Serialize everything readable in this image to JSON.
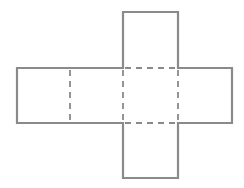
{
  "diagram": {
    "type": "cube-net",
    "stroke_color": "#8a8a8a",
    "solid_width": 2.2,
    "dashed_width": 1.8,
    "faces": [
      {
        "name": "top",
        "x": 123,
        "y": 12,
        "w": 55,
        "h": 56
      },
      {
        "name": "far-left",
        "x": 17,
        "y": 68,
        "w": 53,
        "h": 55
      },
      {
        "name": "left",
        "x": 70,
        "y": 68,
        "w": 53,
        "h": 55
      },
      {
        "name": "center",
        "x": 123,
        "y": 68,
        "w": 55,
        "h": 55
      },
      {
        "name": "right",
        "x": 178,
        "y": 68,
        "w": 54,
        "h": 55
      },
      {
        "name": "bottom",
        "x": 123,
        "y": 123,
        "w": 55,
        "h": 55
      }
    ]
  }
}
